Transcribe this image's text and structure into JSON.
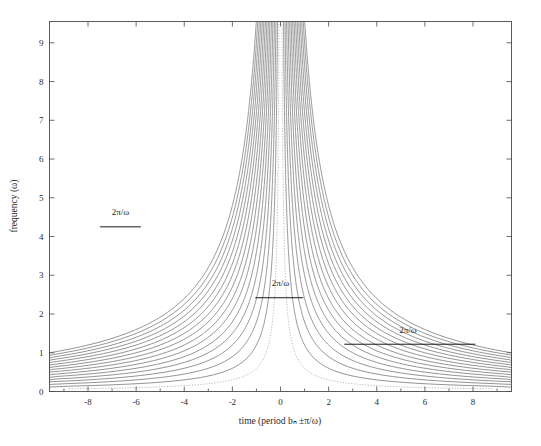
{
  "figure": {
    "background": "#ffffff",
    "frame_color": "#4a4a4a",
    "curve_color": "#5a5a5a",
    "dotted_curve_color": "#9a9a9a",
    "annotation_color": "#1a1a1a"
  },
  "chart_data": {
    "type": "line",
    "title": "",
    "subtitle": "",
    "xlabel": "time (period bₙ ±π/ω)",
    "ylabel": "frequency (ω)",
    "xlim": [
      -9.6,
      9.6
    ],
    "ylim": [
      0,
      9.55
    ],
    "grid": false,
    "legend": null,
    "xticks": [
      -8,
      -6,
      -4,
      -2,
      0,
      2,
      4,
      6,
      8
    ],
    "xtick_labels": [
      "-8",
      "-6",
      "-4",
      "-2",
      "0",
      "2",
      "4",
      "6",
      "8"
    ],
    "xminor_ticks": [
      -9,
      -7,
      -5,
      -3,
      -1,
      1,
      3,
      5,
      7,
      9
    ],
    "yticks": [
      0,
      1,
      2,
      3,
      4,
      5,
      6,
      7,
      8,
      9
    ],
    "ytick_labels": [
      "0",
      "1",
      "2",
      "3",
      "4",
      "5",
      "6",
      "7",
      "8",
      "9"
    ],
    "series": [
      {
        "name": "k=1",
        "style": "dotted",
        "constant": 1,
        "color": "#9a9a9a"
      },
      {
        "name": "k=2",
        "style": "solid",
        "constant": 2,
        "color": "#5a5a5a"
      },
      {
        "name": "k=3",
        "style": "solid",
        "constant": 3,
        "color": "#5a5a5a"
      },
      {
        "name": "k=4",
        "style": "solid",
        "constant": 4,
        "color": "#5a5a5a"
      },
      {
        "name": "k=5",
        "style": "solid",
        "constant": 5,
        "color": "#5a5a5a"
      },
      {
        "name": "k=6",
        "style": "solid",
        "constant": 6,
        "color": "#5a5a5a"
      },
      {
        "name": "k=7",
        "style": "solid",
        "constant": 7,
        "color": "#5a5a5a"
      },
      {
        "name": "k=8",
        "style": "solid",
        "constant": 8,
        "color": "#5a5a5a"
      },
      {
        "name": "k=9",
        "style": "solid",
        "constant": 9,
        "color": "#5a5a5a"
      },
      {
        "name": "k=10",
        "style": "solid",
        "constant": 10,
        "color": "#5a5a5a"
      },
      {
        "name": "k=11",
        "style": "solid",
        "constant": 11,
        "color": "#5a5a5a"
      },
      {
        "name": "k=12",
        "style": "solid",
        "constant": 12,
        "color": "#5a5a5a"
      },
      {
        "name": "k=13",
        "style": "solid",
        "constant": 13,
        "color": "#5a5a5a"
      },
      {
        "name": "k=14",
        "style": "solid",
        "constant": 14,
        "color": "#5a5a5a"
      },
      {
        "name": "k=15",
        "style": "solid",
        "constant": 15,
        "color": "#5a5a5a"
      },
      {
        "name": "k=16",
        "style": "solid",
        "constant": 16,
        "color": "#5a5a5a"
      }
    ],
    "annotations": [
      {
        "id": "annot-upper-left",
        "text": "2π/ω",
        "x_start": -7.5,
        "x_end": -5.8,
        "y": 4.25,
        "label_x": -6.65,
        "label_y": 4.55
      },
      {
        "id": "annot-center",
        "text": "2π/ω",
        "x_start": -1.05,
        "x_end": 0.95,
        "y": 2.42,
        "label_x": 0.0,
        "label_y": 2.72
      },
      {
        "id": "annot-lower-right",
        "text": "2π/ω",
        "x_start": 2.65,
        "x_end": 8.1,
        "y": 1.22,
        "label_x": 5.3,
        "label_y": 1.52
      }
    ]
  }
}
